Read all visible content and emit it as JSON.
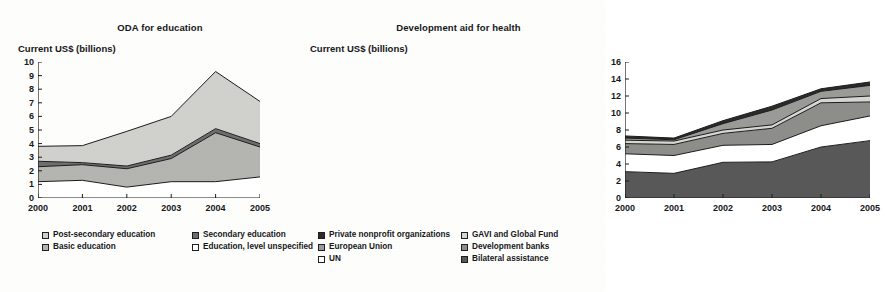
{
  "figure": {
    "background_color": "#fdfdfc",
    "panels": [
      "education",
      "health"
    ]
  },
  "education": {
    "title": "ODA for education",
    "axis_caption": "Current US$ (billions)",
    "y_ticks": [
      "0",
      "1",
      "2",
      "3",
      "4",
      "5",
      "6",
      "7",
      "8",
      "9",
      "10"
    ],
    "x_ticks": [
      "2000",
      "2001",
      "2002",
      "2003",
      "2004",
      "2005"
    ],
    "legend": [
      {
        "label": "Post-secondary education",
        "color": "#d0d0cd"
      },
      {
        "label": "Secondary education",
        "color": "#6e6e6e"
      },
      {
        "label": "Basic education",
        "color": "#b4b4b0"
      },
      {
        "label": "Education, level unspecified",
        "color": "#ffffff"
      }
    ]
  },
  "health": {
    "title": "Development aid for health",
    "axis_caption": "Current US$ (billions)",
    "y_ticks": [
      "0",
      "2",
      "4",
      "6",
      "8",
      "10",
      "12",
      "14",
      "16"
    ],
    "x_ticks": [
      "2000",
      "2001",
      "2002",
      "2003",
      "2004",
      "2005"
    ],
    "legend": [
      {
        "label": "Private nonprofit organizations",
        "color": "#2b2b2b"
      },
      {
        "label": "GAVI and Global Fund",
        "color": "#d5d5d2"
      },
      {
        "label": "European Union",
        "color": "#9a9a97"
      },
      {
        "label": "Development banks",
        "color": "#8d8d8a"
      },
      {
        "label": "UN",
        "color": "#ffffff"
      },
      {
        "label": "Bilateral assistance",
        "color": "#585858"
      }
    ]
  },
  "chart_data": [
    {
      "type": "area",
      "id": "oda-for-education",
      "title": "ODA for education",
      "xlabel": "",
      "ylabel": "Current US$ (billions)",
      "x": [
        "2000",
        "2001",
        "2002",
        "2003",
        "2004",
        "2005"
      ],
      "ylim": [
        0,
        10
      ],
      "y_ticks": [
        0,
        1,
        2,
        3,
        4,
        5,
        6,
        7,
        8,
        9,
        10
      ],
      "grid": false,
      "stacked": true,
      "legend_position": "below",
      "stack_order_bottom_to_top": [
        "Education, level unspecified",
        "Basic education",
        "Secondary education",
        "Post-secondary education"
      ],
      "series": [
        {
          "name": "Education, level unspecified",
          "color": "#ffffff",
          "values": [
            1.2,
            1.3,
            0.8,
            1.2,
            1.2,
            1.55
          ]
        },
        {
          "name": "Basic education",
          "color": "#b4b4b0",
          "values": [
            1.1,
            1.15,
            1.35,
            1.7,
            3.6,
            2.2
          ]
        },
        {
          "name": "Secondary education",
          "color": "#6e6e6e",
          "values": [
            0.4,
            0.15,
            0.2,
            0.25,
            0.3,
            0.25
          ]
        },
        {
          "name": "Post-secondary education",
          "color": "#d0d0cd",
          "values": [
            1.1,
            1.25,
            2.55,
            2.85,
            4.2,
            3.1
          ]
        }
      ],
      "cumulative_tops": {
        "Education, level unspecified": [
          1.2,
          1.3,
          0.8,
          1.2,
          1.2,
          1.55
        ],
        "Basic education": [
          2.3,
          2.45,
          2.15,
          2.9,
          4.8,
          3.75
        ],
        "Secondary education": [
          2.7,
          2.6,
          2.35,
          3.15,
          5.1,
          4.0
        ],
        "Post-secondary education": [
          3.8,
          3.85,
          4.9,
          6.0,
          9.3,
          7.1
        ]
      },
      "totals": [
        3.8,
        3.85,
        4.9,
        6.0,
        9.3,
        7.1
      ]
    },
    {
      "type": "area",
      "id": "development-aid-for-health",
      "title": "Development aid for health",
      "xlabel": "",
      "ylabel": "Current US$ (billions)",
      "x": [
        "2000",
        "2001",
        "2002",
        "2003",
        "2004",
        "2005"
      ],
      "ylim": [
        0,
        16
      ],
      "y_ticks": [
        0,
        2,
        4,
        6,
        8,
        10,
        12,
        14,
        16
      ],
      "grid": false,
      "stacked": true,
      "legend_position": "below",
      "stack_order_bottom_to_top": [
        "Bilateral assistance",
        "UN",
        "Development banks",
        "GAVI and Global Fund",
        "European Union",
        "Private nonprofit organizations"
      ],
      "series": [
        {
          "name": "Bilateral assistance",
          "color": "#585858",
          "values": [
            3.1,
            2.9,
            4.2,
            4.25,
            6.0,
            6.75
          ]
        },
        {
          "name": "UN",
          "color": "#ffffff",
          "values": [
            2.1,
            2.1,
            2.0,
            2.05,
            2.5,
            2.9
          ]
        },
        {
          "name": "Development banks",
          "color": "#8d8d8a",
          "values": [
            1.2,
            1.3,
            1.4,
            1.9,
            2.7,
            1.65
          ]
        },
        {
          "name": "GAVI and Global Fund",
          "color": "#d5d5d2",
          "values": [
            0.4,
            0.4,
            0.4,
            0.4,
            0.5,
            0.7
          ]
        },
        {
          "name": "European Union",
          "color": "#9a9a97",
          "values": [
            0.25,
            0.15,
            0.75,
            1.75,
            0.85,
            1.25
          ]
        },
        {
          "name": "Private nonprofit organizations",
          "color": "#2b2b2b",
          "values": [
            0.25,
            0.2,
            0.35,
            0.45,
            0.3,
            0.4
          ]
        }
      ],
      "cumulative_tops": {
        "Bilateral assistance": [
          3.1,
          2.9,
          4.2,
          4.25,
          6.0,
          6.75
        ],
        "UN": [
          5.2,
          5.0,
          6.2,
          6.3,
          8.5,
          9.65
        ],
        "Development banks": [
          6.4,
          6.3,
          7.6,
          8.2,
          11.2,
          11.3
        ],
        "GAVI and Global Fund": [
          6.8,
          6.7,
          8.0,
          8.6,
          11.7,
          12.0
        ],
        "European Union": [
          7.05,
          6.85,
          8.75,
          10.35,
          12.55,
          13.25
        ],
        "Private nonprofit organizations": [
          7.3,
          7.05,
          9.1,
          10.8,
          12.85,
          13.65
        ]
      },
      "totals": [
        7.3,
        7.05,
        9.1,
        10.8,
        12.85,
        13.65
      ]
    }
  ]
}
